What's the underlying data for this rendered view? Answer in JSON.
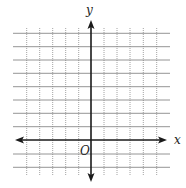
{
  "diagram": {
    "type": "coordinate-plane",
    "labels": {
      "x_axis": "x",
      "y_axis": "y",
      "origin": "O"
    },
    "grid": {
      "vertical_lines_x": [
        26.7,
        39.7,
        52.7,
        65.7,
        78.7,
        104,
        117,
        130,
        143.3,
        156.7
      ],
      "horizontal_lines_y": [
        33.3,
        46.7,
        60,
        73.3,
        86.7,
        100,
        113.3,
        126.7,
        154,
        167.3
      ],
      "x_extent": [
        13,
        170
      ],
      "y_extent": [
        28,
        175
      ]
    },
    "axes": {
      "origin_px": [
        91,
        140
      ],
      "x_axis_from": 15,
      "x_axis_to": 167,
      "y_axis_from": 20,
      "y_axis_to": 182
    },
    "colors": {
      "axis": "#1a1a1a",
      "grid": "#8a8a8a",
      "background": "#ffffff"
    }
  }
}
